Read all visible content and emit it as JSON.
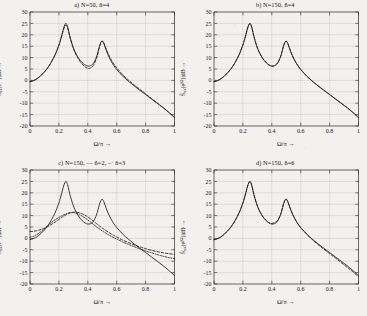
{
  "figure": {
    "background_color": "#f3f1ee",
    "ink_color": "#1b1b1b",
    "grid_color": "#b9b5ae"
  },
  "axes": {
    "xlabel": "Ω/π →",
    "ylabel_prefix": "S",
    "ylabel_sub": "xx",
    "ylabel_mid": "(e",
    "ylabel_sup": "jΩ",
    "ylabel_suffix": ")|dB →",
    "xticks": [
      "0",
      "0.2",
      "0.4",
      "0.6",
      "0.8",
      "1"
    ],
    "xtick_values": [
      0,
      0.2,
      0.4,
      0.6,
      0.8,
      1
    ],
    "yticks": [
      "30",
      "25",
      "20",
      "15",
      "10",
      "5",
      "0",
      "-5",
      "-10",
      "-15",
      "-20"
    ],
    "ytick_values": [
      30,
      25,
      20,
      15,
      10,
      5,
      0,
      -5,
      -10,
      -15,
      -20
    ],
    "xlim": [
      0,
      1
    ],
    "ylim": [
      -20,
      30
    ],
    "grid": true
  },
  "panels": [
    {
      "id": "a",
      "title": "a)   N=50,  n̂=4"
    },
    {
      "id": "b",
      "title": "b)   N=150,  n̂=4"
    },
    {
      "id": "c",
      "title": "c)   N=150, ‒‒ n̂=2, ‒· n̂=3"
    },
    {
      "id": "d",
      "title": "d)   N=150,  n̂=6"
    }
  ],
  "chart_data": [
    {
      "type": "line",
      "panel": "a",
      "title": "a)   N=50,  n̂=4",
      "xlabel": "Ω/π →",
      "ylabel": "Ŝxx(e^{jΩ})|dB →",
      "xlim": [
        0,
        1
      ],
      "ylim": [
        -20,
        30
      ],
      "grid": true,
      "legend_position": "none",
      "x": [
        0,
        0.02,
        0.04,
        0.06,
        0.08,
        0.1,
        0.12,
        0.14,
        0.16,
        0.18,
        0.2,
        0.21,
        0.22,
        0.23,
        0.24,
        0.25,
        0.26,
        0.27,
        0.28,
        0.3,
        0.32,
        0.34,
        0.36,
        0.38,
        0.4,
        0.42,
        0.44,
        0.46,
        0.47,
        0.48,
        0.49,
        0.5,
        0.51,
        0.52,
        0.54,
        0.56,
        0.58,
        0.6,
        0.64,
        0.68,
        0.72,
        0.76,
        0.8,
        0.84,
        0.88,
        0.92,
        0.96,
        1.0
      ],
      "series": [
        {
          "name": "true spectrum (solid)",
          "style": "solid",
          "values": [
            -0.5,
            -0.2,
            0.4,
            1.3,
            2.4,
            3.7,
            5.3,
            7.2,
            9.5,
            12.2,
            15.6,
            17.6,
            19.9,
            22.4,
            24.3,
            25.0,
            23.6,
            21.0,
            18.4,
            14.3,
            11.5,
            9.4,
            7.9,
            6.8,
            6.3,
            6.5,
            7.6,
            10.3,
            12.4,
            14.8,
            16.6,
            17.2,
            16.3,
            14.5,
            11.2,
            8.6,
            6.5,
            4.8,
            2.0,
            -0.3,
            -2.4,
            -4.3,
            -6.2,
            -8.1,
            -10.0,
            -11.9,
            -14.0,
            -16.3
          ]
        },
        {
          "name": "estimate n̂=4 (dashed)",
          "style": "dashed",
          "values": [
            -0.5,
            -0.2,
            0.4,
            1.3,
            2.4,
            3.7,
            5.3,
            7.2,
            9.5,
            12.1,
            15.3,
            17.3,
            19.5,
            21.8,
            23.6,
            24.2,
            23.0,
            20.6,
            18.1,
            14.0,
            11.1,
            8.9,
            7.2,
            6.0,
            5.3,
            5.5,
            6.7,
            9.6,
            11.8,
            14.4,
            16.5,
            17.3,
            16.6,
            15.0,
            11.9,
            9.3,
            7.2,
            5.5,
            2.6,
            0.2,
            -1.9,
            -3.9,
            -5.9,
            -7.9,
            -9.9,
            -11.9,
            -14.0,
            -16.2
          ]
        }
      ]
    },
    {
      "type": "line",
      "panel": "b",
      "title": "b)   N=150,  n̂=4",
      "xlabel": "Ω/π →",
      "ylabel": "Ŝxx(e^{jΩ})|dB →",
      "xlim": [
        0,
        1
      ],
      "ylim": [
        -20,
        30
      ],
      "grid": true,
      "legend_position": "none",
      "x": [
        0,
        0.02,
        0.04,
        0.06,
        0.08,
        0.1,
        0.12,
        0.14,
        0.16,
        0.18,
        0.2,
        0.21,
        0.22,
        0.23,
        0.24,
        0.25,
        0.26,
        0.27,
        0.28,
        0.3,
        0.32,
        0.34,
        0.36,
        0.38,
        0.4,
        0.42,
        0.44,
        0.46,
        0.47,
        0.48,
        0.49,
        0.5,
        0.51,
        0.52,
        0.54,
        0.56,
        0.58,
        0.6,
        0.64,
        0.68,
        0.72,
        0.76,
        0.8,
        0.84,
        0.88,
        0.92,
        0.96,
        1.0
      ],
      "series": [
        {
          "name": "true spectrum (solid)",
          "style": "solid",
          "values": [
            -0.5,
            -0.2,
            0.4,
            1.3,
            2.4,
            3.7,
            5.3,
            7.2,
            9.5,
            12.2,
            15.6,
            17.6,
            19.9,
            22.4,
            24.3,
            25.0,
            23.6,
            21.0,
            18.4,
            14.3,
            11.5,
            9.4,
            7.9,
            6.8,
            6.3,
            6.5,
            7.6,
            10.3,
            12.4,
            14.8,
            16.6,
            17.2,
            16.3,
            14.5,
            11.2,
            8.6,
            6.5,
            4.8,
            2.0,
            -0.3,
            -2.4,
            -4.3,
            -6.2,
            -8.1,
            -10.0,
            -11.9,
            -14.0,
            -16.3
          ]
        },
        {
          "name": "estimate n̂=4 (dashed, near-coincident)",
          "style": "dashed",
          "values": [
            -0.5,
            -0.2,
            0.4,
            1.3,
            2.4,
            3.7,
            5.3,
            7.2,
            9.5,
            12.2,
            15.6,
            17.6,
            19.8,
            22.3,
            24.2,
            24.9,
            23.5,
            21.0,
            18.4,
            14.3,
            11.5,
            9.4,
            7.9,
            6.8,
            6.3,
            6.5,
            7.6,
            10.3,
            12.4,
            14.8,
            16.6,
            17.2,
            16.3,
            14.5,
            11.2,
            8.6,
            6.5,
            4.8,
            2.0,
            -0.3,
            -2.4,
            -4.3,
            -6.2,
            -8.1,
            -10.0,
            -11.9,
            -14.0,
            -16.3
          ]
        }
      ]
    },
    {
      "type": "line",
      "panel": "c",
      "title": "c)   N=150, ‒‒ n̂=2, ‒· n̂=3",
      "xlabel": "Ω/π →",
      "ylabel": "Ŝxx(e^{jΩ})|dB →",
      "xlim": [
        0,
        1
      ],
      "ylim": [
        -20,
        30
      ],
      "grid": true,
      "legend_position": "in-title",
      "x": [
        0,
        0.02,
        0.04,
        0.06,
        0.08,
        0.1,
        0.12,
        0.14,
        0.16,
        0.18,
        0.2,
        0.21,
        0.22,
        0.23,
        0.24,
        0.25,
        0.26,
        0.27,
        0.28,
        0.3,
        0.32,
        0.34,
        0.36,
        0.38,
        0.4,
        0.42,
        0.44,
        0.46,
        0.47,
        0.48,
        0.49,
        0.5,
        0.51,
        0.52,
        0.54,
        0.56,
        0.58,
        0.6,
        0.64,
        0.68,
        0.72,
        0.76,
        0.8,
        0.84,
        0.88,
        0.92,
        0.96,
        1.0
      ],
      "series": [
        {
          "name": "true spectrum (solid)",
          "style": "solid",
          "values": [
            -0.5,
            -0.2,
            0.4,
            1.3,
            2.4,
            3.7,
            5.3,
            7.2,
            9.5,
            12.2,
            15.6,
            17.6,
            19.9,
            22.4,
            24.3,
            25.0,
            23.6,
            21.0,
            18.4,
            14.3,
            11.5,
            9.4,
            7.9,
            6.8,
            6.3,
            6.5,
            7.6,
            10.3,
            12.4,
            14.8,
            16.6,
            17.2,
            16.3,
            14.5,
            11.2,
            8.6,
            6.5,
            4.8,
            2.0,
            -0.3,
            -2.4,
            -4.3,
            -6.2,
            -8.1,
            -10.0,
            -11.9,
            -14.0,
            -16.3
          ]
        },
        {
          "name": "estimate n̂=2 (dashed)",
          "style": "dashed",
          "values": [
            3.0,
            3.1,
            3.3,
            3.6,
            4.0,
            4.5,
            5.1,
            5.8,
            6.6,
            7.4,
            8.3,
            8.8,
            9.2,
            9.6,
            10.0,
            10.4,
            10.7,
            11.0,
            11.2,
            11.5,
            11.5,
            11.3,
            10.8,
            10.2,
            9.4,
            8.5,
            7.5,
            6.5,
            6.0,
            5.5,
            5.0,
            4.6,
            4.1,
            3.7,
            2.8,
            2.0,
            1.3,
            0.6,
            -0.7,
            -1.8,
            -2.8,
            -3.7,
            -4.5,
            -5.2,
            -5.8,
            -6.3,
            -6.7,
            -7.0
          ]
        },
        {
          "name": "estimate n̂=3 (dash-dot)",
          "style": "dashdot",
          "values": [
            0.5,
            0.8,
            1.4,
            2.2,
            3.2,
            4.3,
            5.4,
            6.5,
            7.5,
            8.4,
            9.2,
            9.6,
            9.9,
            10.2,
            10.5,
            10.8,
            11.0,
            11.2,
            11.3,
            11.3,
            11.0,
            10.5,
            9.8,
            9.0,
            8.1,
            7.1,
            6.1,
            5.1,
            4.6,
            4.2,
            3.7,
            3.3,
            2.9,
            2.5,
            1.7,
            1.0,
            0.3,
            -0.3,
            -1.5,
            -2.6,
            -3.6,
            -4.6,
            -5.5,
            -6.3,
            -7.1,
            -7.8,
            -8.4,
            -8.9
          ]
        }
      ]
    },
    {
      "type": "line",
      "panel": "d",
      "title": "d)   N=150,  n̂=6",
      "xlabel": "Ω/π →",
      "ylabel": "Ŝxx(e^{jΩ})|dB →",
      "xlim": [
        0,
        1
      ],
      "ylim": [
        -20,
        30
      ],
      "grid": true,
      "legend_position": "none",
      "x": [
        0,
        0.02,
        0.04,
        0.06,
        0.08,
        0.1,
        0.12,
        0.14,
        0.16,
        0.18,
        0.2,
        0.21,
        0.22,
        0.23,
        0.24,
        0.25,
        0.26,
        0.27,
        0.28,
        0.3,
        0.32,
        0.34,
        0.36,
        0.38,
        0.4,
        0.42,
        0.44,
        0.46,
        0.47,
        0.48,
        0.49,
        0.5,
        0.51,
        0.52,
        0.54,
        0.56,
        0.58,
        0.6,
        0.64,
        0.68,
        0.72,
        0.76,
        0.8,
        0.84,
        0.88,
        0.92,
        0.96,
        1.0
      ],
      "series": [
        {
          "name": "true spectrum (solid)",
          "style": "solid",
          "values": [
            -0.5,
            -0.2,
            0.4,
            1.3,
            2.4,
            3.7,
            5.3,
            7.2,
            9.5,
            12.2,
            15.6,
            17.6,
            19.9,
            22.4,
            24.3,
            25.0,
            23.6,
            21.0,
            18.4,
            14.3,
            11.5,
            9.4,
            7.9,
            6.8,
            6.3,
            6.5,
            7.6,
            10.3,
            12.4,
            14.8,
            16.6,
            17.2,
            16.3,
            14.5,
            11.2,
            8.6,
            6.5,
            4.8,
            2.0,
            -0.3,
            -2.4,
            -4.3,
            -6.2,
            -8.1,
            -10.0,
            -11.9,
            -14.0,
            -16.3
          ]
        },
        {
          "name": "estimate n̂=6 (dashed)",
          "style": "dashed",
          "values": [
            -0.6,
            -0.3,
            0.3,
            1.2,
            2.3,
            3.6,
            5.2,
            7.1,
            9.4,
            12.1,
            15.5,
            17.5,
            19.8,
            22.3,
            24.2,
            24.9,
            23.5,
            20.9,
            18.3,
            14.2,
            11.4,
            9.3,
            7.9,
            6.9,
            6.6,
            6.9,
            7.9,
            10.4,
            12.5,
            14.9,
            16.7,
            17.2,
            16.2,
            14.4,
            11.1,
            8.5,
            6.4,
            4.7,
            1.9,
            -0.5,
            -2.7,
            -4.7,
            -6.7,
            -8.6,
            -10.6,
            -12.6,
            -14.6,
            -16.8
          ]
        }
      ]
    }
  ]
}
